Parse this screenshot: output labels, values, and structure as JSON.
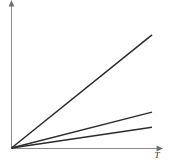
{
  "figure": {
    "background_color": "#ffffff",
    "axis_color": "#8a8a8a",
    "line_color": "#2b2b2b",
    "xlabel": "T",
    "ylabel": ""
  },
  "chart_data": {
    "type": "line",
    "title": "",
    "subtitle": "",
    "xlabel": "T",
    "ylabel": "",
    "grid": false,
    "legend": false,
    "legend_position": "none",
    "xlim": [
      0,
      1
    ],
    "ylim": [
      0,
      1
    ],
    "xticks": [],
    "yticks": [],
    "annotations": [],
    "series": [
      {
        "name": "line-1",
        "slope": 0.82,
        "x": [
          0,
          1
        ],
        "values": [
          0,
          0.82
        ]
      },
      {
        "name": "line-2",
        "slope": 0.26,
        "x": [
          0,
          1
        ],
        "values": [
          0,
          0.26
        ]
      },
      {
        "name": "line-3",
        "slope": 0.15,
        "x": [
          0,
          1
        ],
        "values": [
          0,
          0.15
        ]
      }
    ]
  }
}
